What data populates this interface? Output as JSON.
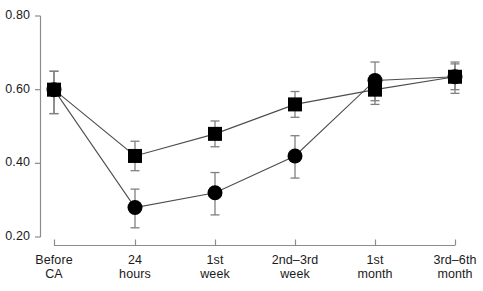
{
  "chart_data": {
    "type": "line",
    "title": "",
    "xlabel": "",
    "ylabel": "",
    "categories": [
      "Before CA",
      "24 hours",
      "1st week",
      "2nd–3rd week",
      "1st month",
      "3rd–6th month"
    ],
    "category_lines": [
      [
        "Before",
        "CA"
      ],
      [
        "24",
        "hours"
      ],
      [
        "1st",
        "week"
      ],
      [
        "2nd–3rd",
        "week"
      ],
      [
        "1st",
        "month"
      ],
      [
        "3rd–6th",
        "month"
      ]
    ],
    "ylim": [
      0.2,
      0.8
    ],
    "yticks": [
      0.8,
      0.6,
      0.4,
      0.2
    ],
    "ytick_labels": [
      "0.80",
      "0.60",
      "0.40",
      "0.20"
    ],
    "grid": false,
    "legend": "none",
    "marker_color": "#000000",
    "line_color": "#4d4d4d",
    "errorbar_color": "#808080",
    "series": [
      {
        "name": "square-series",
        "marker": "square",
        "values": [
          0.6,
          0.42,
          0.48,
          0.56,
          0.6,
          0.635
        ],
        "err_low": [
          0.065,
          0.04,
          0.035,
          0.035,
          0.04,
          0.035
        ],
        "err_high": [
          0.05,
          0.04,
          0.035,
          0.035,
          0.04,
          0.035
        ]
      },
      {
        "name": "circle-series",
        "marker": "circle",
        "values": [
          0.6,
          0.28,
          0.32,
          0.42,
          0.625,
          0.635
        ],
        "err_low": [
          0.065,
          0.055,
          0.06,
          0.06,
          0.055,
          0.045
        ],
        "err_high": [
          0.05,
          0.05,
          0.055,
          0.055,
          0.05,
          0.04
        ]
      }
    ]
  },
  "axis": {
    "y_labels": [
      "0.80",
      "0.60",
      "0.40",
      "0.20"
    ],
    "x_labels": [
      {
        "line1": "Before",
        "line2": "CA"
      },
      {
        "line1": "24",
        "line2": "hours"
      },
      {
        "line1": "1st",
        "line2": "week"
      },
      {
        "line1": "2nd–3rd",
        "line2": "week"
      },
      {
        "line1": "1st",
        "line2": "month"
      },
      {
        "line1": "3rd–6th",
        "line2": "month"
      }
    ]
  }
}
